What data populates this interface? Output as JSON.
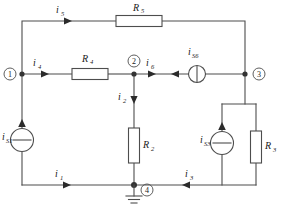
{
  "figure": {
    "kind": "electrical-circuit-diagram"
  },
  "nodes": [
    {
      "id": "n1",
      "label": "1",
      "x": 22,
      "y": 74
    },
    {
      "id": "n2",
      "label": "2",
      "x": 134,
      "y": 74
    },
    {
      "id": "n3",
      "label": "3",
      "x": 254,
      "y": 74
    },
    {
      "id": "n4",
      "label": "4",
      "x": 139,
      "y": 185
    }
  ],
  "components": [
    {
      "id": "R5",
      "type": "resistor",
      "orientation": "horizontal",
      "label": "R",
      "sub": "5"
    },
    {
      "id": "R4",
      "type": "resistor",
      "orientation": "horizontal",
      "label": "R",
      "sub": "4"
    },
    {
      "id": "R2",
      "type": "resistor",
      "orientation": "vertical",
      "label": "R",
      "sub": "2"
    },
    {
      "id": "R3",
      "type": "resistor",
      "orientation": "vertical",
      "label": "R",
      "sub": "3"
    },
    {
      "id": "iS1",
      "type": "current-source",
      "orientation": "vertical",
      "direction": "up",
      "label": "i",
      "sub": "S1"
    },
    {
      "id": "iS3",
      "type": "current-source",
      "orientation": "vertical",
      "direction": "up",
      "label": "i",
      "sub": "S3"
    },
    {
      "id": "iS6",
      "type": "current-source",
      "orientation": "horizontal",
      "direction": "left",
      "label": "i",
      "sub": "S6"
    }
  ],
  "currents": [
    {
      "id": "i5",
      "label": "i",
      "sub": "5",
      "direction": "right",
      "branch": "top-branch-through-R5"
    },
    {
      "id": "i4",
      "label": "i",
      "sub": "4",
      "direction": "right",
      "branch": "node1-to-R4"
    },
    {
      "id": "i6",
      "label": "i",
      "sub": "6",
      "direction": "right",
      "branch": "node2-to-source-iS6"
    },
    {
      "id": "i2",
      "label": "i",
      "sub": "2",
      "direction": "down",
      "branch": "node2-through-R2"
    },
    {
      "id": "i1",
      "label": "i",
      "sub": "1",
      "direction": "right",
      "branch": "bottom-left-to-node4"
    },
    {
      "id": "i3",
      "label": "i",
      "sub": "3",
      "direction": "left",
      "branch": "bottom-right-to-node4"
    }
  ],
  "ground": {
    "id": "gnd",
    "label": "",
    "attached_to": "4"
  },
  "colors": {
    "wire": "#4d4d4d",
    "text": "#1a1a1a",
    "background": "#ffffff",
    "node_dot": "#333333"
  }
}
